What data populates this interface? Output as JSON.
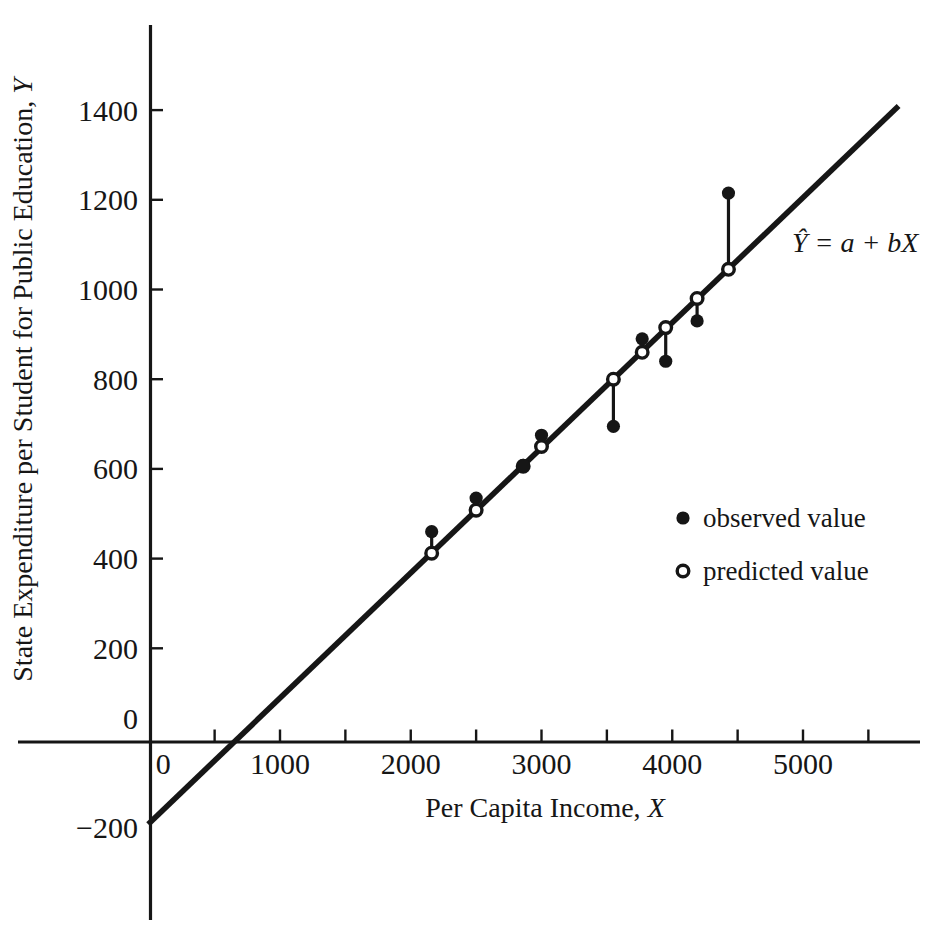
{
  "figure": {
    "background": "#ffffff",
    "ink": "#161616"
  },
  "chart_data": {
    "type": "scatter",
    "title": "",
    "x_axis": {
      "title": "Per Capita Income, ",
      "title_var": "X",
      "ticks": [
        500,
        1000,
        1500,
        2000,
        2500,
        3000,
        3500,
        4000,
        4500,
        5000,
        5500
      ],
      "tick_labels": [
        {
          "value": 0,
          "label": "0",
          "dx": 14
        },
        {
          "value": 1000,
          "label": "1000"
        },
        {
          "value": 2000,
          "label": "2000"
        },
        {
          "value": 3000,
          "label": "3000"
        },
        {
          "value": 4000,
          "label": "4000"
        },
        {
          "value": 5000,
          "label": "5000"
        }
      ],
      "range_shown": [
        -1000,
        5900
      ]
    },
    "y_axis": {
      "title": "State Expenditure per Student for Public Education, ",
      "title_var": "Y",
      "ticks": [
        200,
        400,
        600,
        800,
        1000,
        1200,
        1400
      ],
      "tick_labels": [
        {
          "value": 1400,
          "label": "1400"
        },
        {
          "value": 1200,
          "label": "1200"
        },
        {
          "value": 1000,
          "label": "1000"
        },
        {
          "value": 800,
          "label": "800"
        },
        {
          "value": 600,
          "label": "600"
        },
        {
          "value": 400,
          "label": "400"
        },
        {
          "value": 200,
          "label": "200"
        },
        {
          "value": 0,
          "label": "0",
          "dy": -20
        },
        {
          "value": -200,
          "label": "−200"
        }
      ],
      "range_shown": [
        -400,
        1590
      ]
    },
    "points": [
      {
        "x": 2160,
        "observed": 460,
        "predicted": 412
      },
      {
        "x": 2500,
        "observed": 535,
        "predicted": 508
      },
      {
        "x": 2860,
        "observed": 608,
        "predicted": 606
      },
      {
        "x": 3000,
        "observed": 675,
        "predicted": 650
      },
      {
        "x": 3550,
        "observed": 695,
        "predicted": 800
      },
      {
        "x": 3770,
        "observed": 890,
        "predicted": 860
      },
      {
        "x": 3950,
        "observed": 840,
        "predicted": 915
      },
      {
        "x": 4190,
        "observed": 930,
        "predicted": 980
      },
      {
        "x": 4430,
        "observed": 1215,
        "predicted": 1045
      }
    ],
    "line": {
      "equation_label": "Ŷ = a + bX",
      "slope_estimate": 0.279,
      "intercept_estimate": -190,
      "x_min": -8,
      "x_max": 5731
    },
    "legend": {
      "items": [
        {
          "marker": "observed-dot",
          "label": "observed value"
        },
        {
          "marker": "predicted-circle",
          "label": "predicted value"
        }
      ]
    }
  }
}
